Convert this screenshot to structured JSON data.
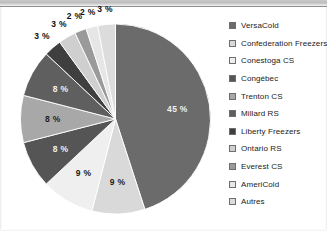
{
  "chart_data": {
    "type": "pie",
    "title": "",
    "subtitle": "",
    "xlabel": "",
    "ylabel": "",
    "grid": false,
    "legend_position": "right",
    "start_angle_deg": 0,
    "direction": "clockwise",
    "categories": [
      "VersaCold",
      "Confederation Freezers",
      "Conestoga CS",
      "Congébec",
      "Trenton CS",
      "Millard RS",
      "Liberty Freezers",
      "Ontario RS",
      "Everest CS",
      "AmeriCold",
      "Autres"
    ],
    "values": [
      45,
      9,
      9,
      8,
      8,
      8,
      3,
      3,
      2,
      2,
      3
    ],
    "data_labels": [
      "45 %",
      "9 %",
      "9 %",
      "8 %",
      "8 %",
      "8 %",
      "3 %",
      "3 %",
      "2 %",
      "2 %",
      "3 %"
    ],
    "colors": [
      "#6b6b6b",
      "#d9d9d9",
      "#efefef",
      "#555555",
      "#a8a8a8",
      "#5f5f5f",
      "#3f3f3f",
      "#cfcfcf",
      "#9a9a9a",
      "#e6e6e6",
      "#dcdcdc"
    ]
  },
  "legend": {
    "items": [
      {
        "label": "VersaCold",
        "color": "#6b6b6b"
      },
      {
        "label": "Confederation Freezers",
        "color": "#d9d9d9"
      },
      {
        "label": "Conestoga CS",
        "color": "#efefef"
      },
      {
        "label": "Congébec",
        "color": "#555555"
      },
      {
        "label": "Trenton CS",
        "color": "#a8a8a8"
      },
      {
        "label": "Millard RS",
        "color": "#5f5f5f"
      },
      {
        "label": "Liberty Freezers",
        "color": "#3f3f3f"
      },
      {
        "label": "Ontario RS",
        "color": "#cfcfcf"
      },
      {
        "label": "Everest CS",
        "color": "#9a9a9a"
      },
      {
        "label": "AmeriCold",
        "color": "#e6e6e6"
      },
      {
        "label": "Autres",
        "color": "#dcdcdc"
      }
    ]
  }
}
